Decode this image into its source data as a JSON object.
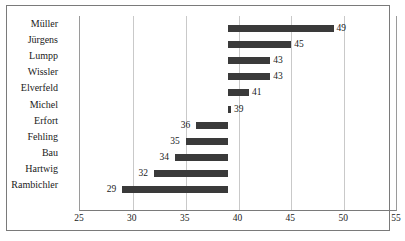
{
  "chart_data": {
    "type": "bar",
    "orientation": "horizontal",
    "title": "",
    "subtitle": "",
    "xlabel": "",
    "ylabel": "",
    "xlim": [
      25,
      55
    ],
    "xticks": [
      25,
      30,
      35,
      40,
      45,
      50,
      55
    ],
    "grid": true,
    "legend": null,
    "baseline": 39,
    "bar_color": "#3a3a3a",
    "categories": [
      "Müller",
      "Jürgens",
      "Lumpp",
      "Wissler",
      "Elverfeld",
      "Michel",
      "Erfort",
      "Fehling",
      "Bau",
      "Hartwig",
      "Rambichler"
    ],
    "values": [
      49,
      45,
      43,
      43,
      41,
      39,
      36,
      35,
      34,
      32,
      29
    ],
    "data_labels": [
      "49",
      "45",
      "43",
      "43",
      "41",
      "39",
      "36",
      "35",
      "34",
      "32",
      "29"
    ]
  }
}
